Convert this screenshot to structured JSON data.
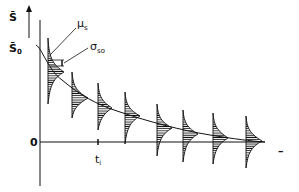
{
  "diagram": {
    "y_axis_label": "S̄",
    "y_start_label": "S̄",
    "y_start_sub": "0",
    "zero_label": "0",
    "time_label": "t",
    "time_sub": "i",
    "mean_label": "μ",
    "mean_sub": "s",
    "sigma_label": "σ",
    "sigma_sub": "so",
    "x_axis_end_mark": "–",
    "distributions_count": 8,
    "colors": {
      "ink": "#111111",
      "background": "#ffffff"
    }
  }
}
